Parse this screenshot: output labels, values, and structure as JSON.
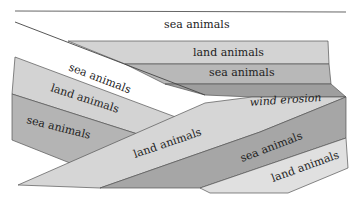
{
  "diagram": {
    "colors": {
      "background": "#ffffff",
      "line": "#444444",
      "white_band": "#ffffff",
      "light": "#d3d3d3",
      "lightest": "#e2e2e2",
      "mid": "#b8b8b8",
      "dark": "#9e9e9e",
      "darker": "#a9a9a9"
    },
    "layers": [
      {
        "id": "top-sea",
        "label": "sea animals",
        "shade": "white"
      },
      {
        "id": "upper-land",
        "label": "land animals",
        "shade": "light"
      },
      {
        "id": "upper-sea",
        "label": "sea animals",
        "shade": "mid"
      },
      {
        "id": "upper-dark",
        "label": "",
        "shade": "dark"
      },
      {
        "id": "tilted-sea",
        "label": "sea animals",
        "shade": "white"
      },
      {
        "id": "tilted-land",
        "label": "land animals",
        "shade": "light"
      },
      {
        "id": "tilted-sea-2",
        "label": "sea animals",
        "shade": "mid"
      },
      {
        "id": "erosion-surface",
        "label": "wind erosion",
        "shade": "none"
      },
      {
        "id": "lower-land",
        "label": "land animals",
        "shade": "light"
      },
      {
        "id": "lower-sea",
        "label": "sea animals",
        "shade": "dark"
      },
      {
        "id": "lower-land-2",
        "label": "land animals",
        "shade": "lightest"
      }
    ]
  }
}
